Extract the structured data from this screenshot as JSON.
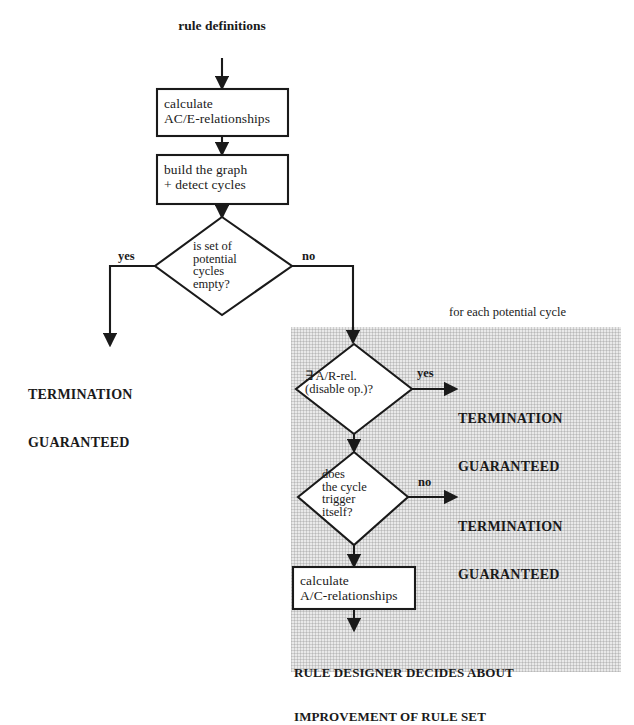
{
  "diagram": {
    "title_source": "rule definitions",
    "panel_label": "for each potential cycle",
    "process_boxes": [
      {
        "id": "calc-ace",
        "text": "calculate\nAC/E-relationships"
      },
      {
        "id": "build-graph",
        "text": "build the graph\n+ detect cycles"
      },
      {
        "id": "calc-ac",
        "text": "calculate\nA/C-relationships"
      }
    ],
    "decisions": [
      {
        "id": "set-empty",
        "text": "is set of\npotential\ncycles\nempty?"
      },
      {
        "id": "ar-rel",
        "text": "∃ A/R-rel.\n(disable op.)?"
      },
      {
        "id": "cycle-trigger",
        "text": "does\nthe cycle\ntrigger\nitself?"
      }
    ],
    "branch_labels": {
      "d1_yes": "yes",
      "d1_no": "no",
      "d2_yes": "yes",
      "d3_no": "no"
    },
    "terminals": [
      {
        "id": "term-left",
        "line1": "TERMINATION",
        "line2": "GUARANTEED"
      },
      {
        "id": "term-ar",
        "line1": "TERMINATION",
        "line2": "GUARANTEED"
      },
      {
        "id": "term-cycle",
        "line1": "TERMINATION",
        "line2": "GUARANTEED"
      }
    ],
    "final_outcome": {
      "line1": "RULE DESIGNER DECIDES ABOUT",
      "line2": "IMPROVEMENT OF RULE SET"
    },
    "colors": {
      "ink": "#1a1a1a",
      "paper": "#ffffff",
      "panel_fill": "#e9e9e9",
      "box_fill": "#ffffff"
    }
  }
}
